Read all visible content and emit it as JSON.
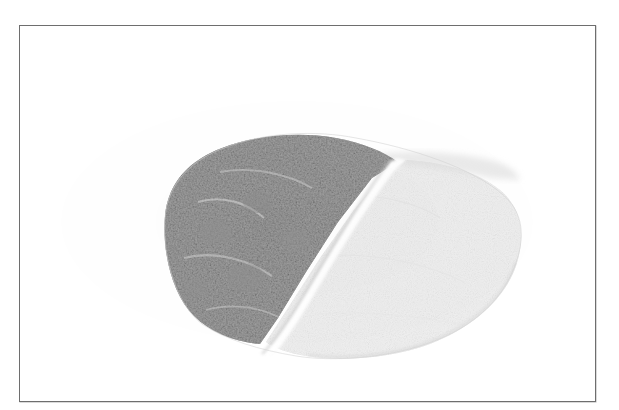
{
  "plate": {
    "background_color": "#ffffff",
    "frame_color": "#6e6e6e",
    "frame_style": "thin-single-rule",
    "caption": "",
    "label": "",
    "scale_bar": ""
  },
  "specimen": {
    "kind": "histological-section-micrograph",
    "print_process": "halftone-screened-monochrome",
    "overall_shape": "broad-ovoid-transverse-section",
    "orientation": "landscape",
    "regions": [
      {
        "id": "dark-lobe",
        "name": "densely-stained-region",
        "position": "left",
        "tone_hex": "#9a9a9a",
        "core_tone_hex": "#8a8a8a",
        "edge_tone_hex": "#b6b6b6",
        "texture": "coarse-granular-speckled",
        "relative_area": 0.46
      },
      {
        "id": "pale-lobe",
        "name": "lightly-stained-region",
        "position": "right",
        "tone_hex": "#f2f2f2",
        "core_tone_hex": "#ededed",
        "edge_tone_hex": "#e2e2e2",
        "texture": "fine-faint-halftone",
        "relative_area": 0.54
      },
      {
        "id": "cleft",
        "name": "bright-dividing-fissure",
        "position": "diagonal-center",
        "tone_hex": "#ffffff",
        "texture": "smooth-unstained-band",
        "relative_area": 0.03
      }
    ],
    "bounds_px": {
      "left": 143,
      "top": 112,
      "right": 503,
      "bottom": 337
    }
  },
  "palette": {
    "paper": "#ffffff",
    "frame": "#6e6e6e",
    "dark_tissue": "#9a9a9a",
    "mid_tissue": "#c4c4c4",
    "pale_tissue": "#f0f0f0",
    "cleft_white": "#ffffff",
    "outline": "#cccccc"
  }
}
